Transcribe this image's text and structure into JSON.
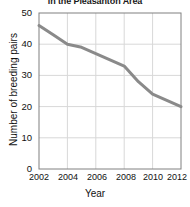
{
  "chart_data": {
    "type": "line",
    "title": "in the Pleasanton Area",
    "xlabel": "Year",
    "ylabel": "Number of breeding pairs",
    "x": [
      2002,
      2003,
      2004,
      2005,
      2006,
      2007,
      2008,
      2009,
      2010,
      2011,
      2012
    ],
    "values": [
      46,
      43,
      40,
      39,
      37,
      35,
      33,
      28,
      24,
      22,
      20
    ],
    "series": [
      {
        "name": "Number of breeding pairs",
        "values": [
          46,
          43,
          40,
          39,
          37,
          35,
          33,
          28,
          24,
          22,
          20
        ]
      }
    ],
    "xlim": [
      2002,
      2012
    ],
    "ylim": [
      0,
      50
    ],
    "xticks": [
      "2002",
      "2004",
      "2006",
      "2008",
      "2010",
      "2012"
    ],
    "xtick_values": [
      2002,
      2004,
      2006,
      2008,
      2010,
      2012
    ],
    "yticks": [
      "0",
      "10",
      "20",
      "30",
      "40",
      "50"
    ],
    "ytick_values": [
      0,
      10,
      20,
      30,
      40,
      50
    ],
    "grid": true,
    "legend": false,
    "line_color": "#8a8a8a",
    "grid_color": "#d8d8d8",
    "axis_color": "#808080",
    "background_color": "#ffffff"
  }
}
